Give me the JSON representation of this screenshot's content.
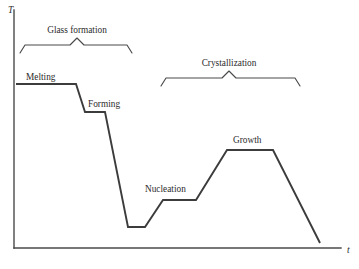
{
  "figure": {
    "domain": "diagram",
    "background_color": "#ffffff",
    "curve_color": "#3c3c3c",
    "axis_color": "#4a4a4a",
    "text_color": "#2b2b2b"
  },
  "axes": {
    "y_label": "T",
    "x_label": "t",
    "y_label_position": {
      "x": 8,
      "y": 13
    },
    "x_label_position": {
      "x": 347,
      "y": 253
    },
    "y_axis": {
      "x": 14,
      "y_top": 10,
      "y_bottom": 248
    },
    "x_axis": {
      "y": 248,
      "x_left": 14,
      "x_right": 341
    }
  },
  "curve": {
    "name": "temperature-time-profile",
    "points": [
      {
        "x": 16,
        "y": 84,
        "stage": "melting-start"
      },
      {
        "x": 76,
        "y": 84,
        "stage": "melting-end"
      },
      {
        "x": 85,
        "y": 112,
        "stage": "forming-start"
      },
      {
        "x": 105,
        "y": 112,
        "stage": "forming-end"
      },
      {
        "x": 128,
        "y": 227,
        "stage": "quench-bottom-start"
      },
      {
        "x": 145,
        "y": 227,
        "stage": "quench-bottom-end"
      },
      {
        "x": 163,
        "y": 200,
        "stage": "nucleation-start"
      },
      {
        "x": 196,
        "y": 200,
        "stage": "nucleation-end"
      },
      {
        "x": 227,
        "y": 150,
        "stage": "growth-start"
      },
      {
        "x": 273,
        "y": 150,
        "stage": "growth-end"
      },
      {
        "x": 320,
        "y": 243,
        "stage": "final-cooling"
      }
    ]
  },
  "braces": [
    {
      "id": "glass-formation",
      "label": "Glass formation",
      "label_x": 77,
      "label_y": 33,
      "x_left": 20,
      "x_right": 132,
      "y_base": 45,
      "peak_x": 77,
      "peak_y": 38,
      "tip_drop": 8
    },
    {
      "id": "crystallization",
      "label": "Crystallization",
      "label_x": 229,
      "label_y": 66,
      "x_left": 161,
      "x_right": 300,
      "y_base": 78,
      "peak_x": 229,
      "peak_y": 71,
      "tip_drop": 8
    }
  ],
  "stage_labels": [
    {
      "id": "melting",
      "text": "Melting",
      "x": 26,
      "y": 80
    },
    {
      "id": "forming",
      "text": "Forming",
      "x": 88,
      "y": 107
    },
    {
      "id": "nucleation",
      "text": "Nucleation",
      "x": 145,
      "y": 192
    },
    {
      "id": "growth",
      "text": "Growth",
      "x": 233,
      "y": 143
    }
  ]
}
